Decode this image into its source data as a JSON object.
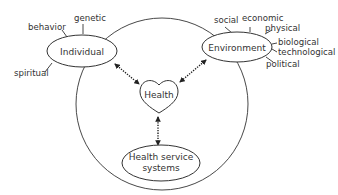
{
  "diagram": {
    "title": "",
    "nodes": {
      "individual": {
        "label": "Individual",
        "factors": [
          "behavior",
          "genetic",
          "spiritual"
        ]
      },
      "environment": {
        "label": "Environment",
        "factors": [
          "social",
          "economic",
          "physical",
          "biological",
          "technological",
          "political"
        ]
      },
      "health": {
        "label": "Health"
      },
      "health_service": {
        "label_line1": "Health service",
        "label_line2": "systems"
      }
    },
    "connections": [
      {
        "from": "Individual",
        "to": "Health",
        "style": "dotted-bidirectional"
      },
      {
        "from": "Environment",
        "to": "Health",
        "style": "dotted-bidirectional"
      },
      {
        "from": "Health service systems",
        "to": "Health",
        "style": "dotted-bidirectional"
      }
    ],
    "colors": {
      "stroke": "#333333",
      "background": "#ffffff"
    }
  }
}
